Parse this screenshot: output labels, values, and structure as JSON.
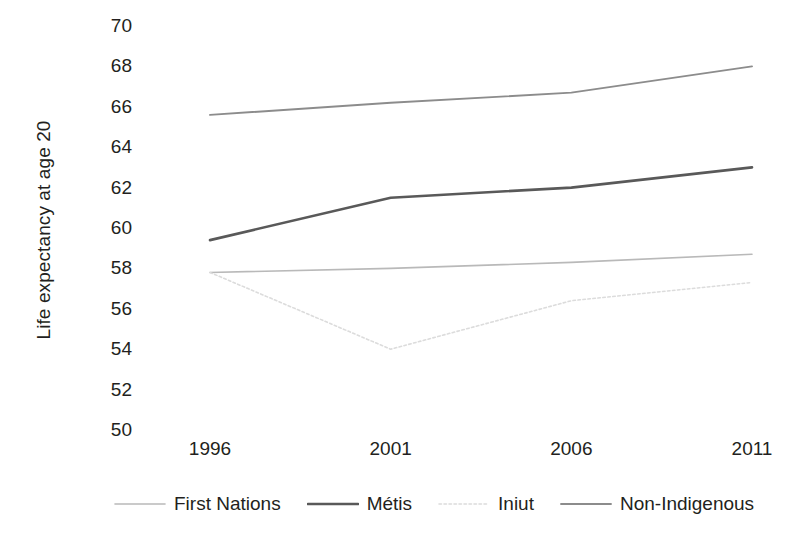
{
  "chart_data": {
    "type": "line",
    "title": "",
    "xlabel": "",
    "ylabel": "Life expectancy at age 20",
    "x": [
      1996,
      2001,
      2006,
      2011
    ],
    "categories": [
      "1996",
      "2001",
      "2006",
      "2011"
    ],
    "ylim": [
      50,
      70
    ],
    "yticks": [
      70,
      68,
      66,
      64,
      62,
      60,
      58,
      56,
      54,
      52,
      50
    ],
    "ytick_labels": [
      "70",
      "68",
      "66",
      "64",
      "62",
      "60",
      "58",
      "56",
      "54",
      "52",
      "50"
    ],
    "xlim": [
      1996,
      2011
    ],
    "grid": false,
    "legend_position": "bottom",
    "series": [
      {
        "name": "First Nations",
        "values": [
          57.8,
          58.0,
          58.3,
          58.7
        ],
        "color": "#b9b9b9",
        "style": "solid",
        "width": 1.6
      },
      {
        "name": "Métis",
        "values": [
          59.4,
          61.5,
          62.0,
          63.0
        ],
        "color": "#595959",
        "style": "solid",
        "width": 2.6
      },
      {
        "name": "Iniut",
        "values": [
          57.8,
          54.0,
          56.4,
          57.3
        ],
        "color": "#dcdcdc",
        "style": "dotted",
        "width": 1.6
      },
      {
        "name": "Non-Indigenous",
        "values": [
          65.6,
          66.2,
          66.7,
          68.0
        ],
        "color": "#8c8c8c",
        "style": "solid",
        "width": 1.9
      }
    ]
  },
  "axis": {
    "y_title": "Life expectancy at age 20"
  },
  "legend": {
    "entries": [
      {
        "label": "First Nations"
      },
      {
        "label": "Métis"
      },
      {
        "label": "Iniut"
      },
      {
        "label": "Non-Indigenous"
      }
    ]
  }
}
